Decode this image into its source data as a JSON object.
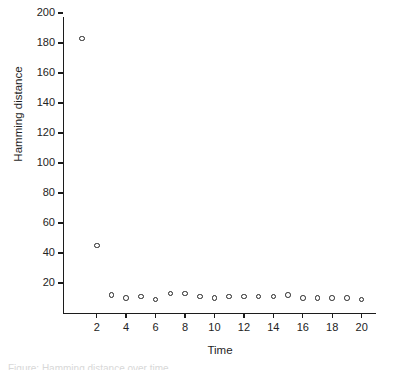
{
  "chart_data": {
    "type": "scatter",
    "title": "",
    "xlabel": "Time",
    "ylabel": "Hamming distance",
    "xlim": [
      0,
      21.3
    ],
    "ylim": [
      0,
      200
    ],
    "grid": false,
    "legend": null,
    "marker": "open-circle",
    "xticks": [
      2,
      4,
      6,
      8,
      10,
      12,
      14,
      16,
      18,
      20
    ],
    "yticks": [
      20,
      40,
      60,
      80,
      100,
      120,
      140,
      160,
      180,
      200
    ],
    "xtick_labels": [
      "2",
      "4",
      "6",
      "8",
      "10",
      "12",
      "14",
      "16",
      "18",
      "20"
    ],
    "ytick_labels": [
      "20",
      "40",
      "60",
      "80",
      "100",
      "120",
      "140",
      "160",
      "180",
      "200"
    ],
    "x": [
      1,
      2,
      3,
      4,
      5,
      6,
      7,
      8,
      9,
      10,
      11,
      12,
      13,
      14,
      15,
      16,
      17,
      18,
      19,
      20
    ],
    "values": [
      183,
      45,
      12,
      10,
      11,
      9,
      13,
      13,
      11,
      10,
      11,
      11,
      11,
      11,
      12,
      10,
      10,
      10,
      10,
      9
    ],
    "series": [
      {
        "name": "Hamming distance",
        "points": [
          {
            "x": 1,
            "y": 183
          },
          {
            "x": 2,
            "y": 45
          },
          {
            "x": 3,
            "y": 12
          },
          {
            "x": 4,
            "y": 10
          },
          {
            "x": 5,
            "y": 11
          },
          {
            "x": 6,
            "y": 9
          },
          {
            "x": 7,
            "y": 13
          },
          {
            "x": 8,
            "y": 13
          },
          {
            "x": 9,
            "y": 11
          },
          {
            "x": 10,
            "y": 10
          },
          {
            "x": 11,
            "y": 11
          },
          {
            "x": 12,
            "y": 11
          },
          {
            "x": 13,
            "y": 11
          },
          {
            "x": 14,
            "y": 11
          },
          {
            "x": 15,
            "y": 12
          },
          {
            "x": 16,
            "y": 10
          },
          {
            "x": 17,
            "y": 10
          },
          {
            "x": 18,
            "y": 10
          },
          {
            "x": 19,
            "y": 10
          },
          {
            "x": 20,
            "y": 9
          }
        ]
      }
    ],
    "colors": {
      "axis": "#1c1c1c",
      "marker_stroke": "#242424",
      "background": "#ffffff",
      "text": "#1f1f1f"
    }
  },
  "caption": {
    "sliver_text": "Figure: Hamming distance over time"
  }
}
